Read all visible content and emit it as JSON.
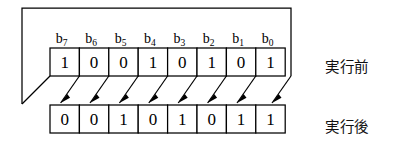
{
  "figure": {
    "bit_labels": [
      "b7",
      "b6",
      "b5",
      "b4",
      "b3",
      "b2",
      "b1",
      "b0"
    ],
    "bit_label_bases": [
      "b",
      "b",
      "b",
      "b",
      "b",
      "b",
      "b",
      "b"
    ],
    "bit_label_subscripts": [
      "7",
      "6",
      "5",
      "4",
      "3",
      "2",
      "1",
      "0"
    ],
    "before": {
      "label": "実行前",
      "bits": [
        "1",
        "0",
        "0",
        "1",
        "0",
        "1",
        "0",
        "1"
      ]
    },
    "after": {
      "label": "実行後",
      "bits": [
        "0",
        "0",
        "1",
        "0",
        "1",
        "0",
        "1",
        "1"
      ]
    },
    "colors": {
      "line": "#000000",
      "cell_fill": "#ffffff",
      "background": "#ffffff",
      "text": "#000000"
    }
  }
}
